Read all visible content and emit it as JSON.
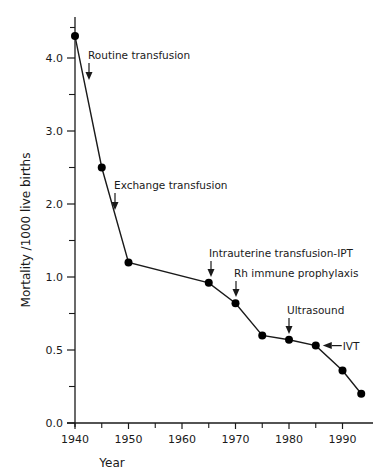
{
  "chart_data": {
    "type": "line",
    "title": "",
    "xlabel": "Year",
    "ylabel": "Mortality /1000 live births",
    "xlim": [
      1940,
      1996
    ],
    "ylim": [
      0.0,
      4.4
    ],
    "y_scale_note": "non-linear axis: 0.0, 0.5, 1.0 then 2.0, 3.0, 4.0 equally spaced",
    "grid": false,
    "legend": null,
    "x_ticks": [
      1940,
      1950,
      1960,
      1970,
      1980,
      1990
    ],
    "x_minor_ticks": [
      1945,
      1955,
      1965,
      1975,
      1985
    ],
    "y_ticks": [
      {
        "value": 0.0,
        "label": "0.0"
      },
      {
        "value": 0.5,
        "label": "0.5"
      },
      {
        "value": 1.0,
        "label": "1.0"
      },
      {
        "value": 2.0,
        "label": "2.0"
      },
      {
        "value": 3.0,
        "label": "3.0"
      },
      {
        "value": 4.0,
        "label": "4.0"
      }
    ],
    "y_minor_ticks": [
      0.25,
      0.75,
      1.5,
      2.5,
      3.5
    ],
    "series": [
      {
        "name": "Mortality",
        "x": [
          1940,
          1945,
          1950,
          1965,
          1970,
          1975,
          1980,
          1985,
          1990,
          1993.5
        ],
        "values": [
          4.3,
          2.5,
          1.2,
          0.96,
          0.82,
          0.6,
          0.57,
          0.53,
          0.36,
          0.2
        ]
      }
    ],
    "annotations": [
      {
        "text": "Routine transfusion",
        "year": 1942.5,
        "arrow": "down"
      },
      {
        "text": "Exchange transfusion",
        "year": 1947.5,
        "arrow": "down"
      },
      {
        "text": "Intrauterine transfusion-IPT",
        "year": 1965,
        "arrow": "down"
      },
      {
        "text": "Rh immune prophylaxis",
        "year": 1970,
        "arrow": "down"
      },
      {
        "text": "Ultrasound",
        "year": 1980,
        "arrow": "down"
      },
      {
        "text": "IVT",
        "year": 1985,
        "arrow": "left"
      }
    ]
  },
  "colors": {
    "line": "#1a1a1a",
    "marker": "#000000",
    "axis": "#1a1a1a",
    "background": "#ffffff"
  }
}
